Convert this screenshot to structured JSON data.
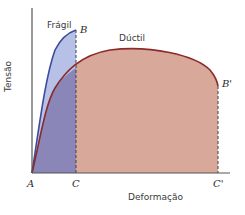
{
  "diagram": {
    "type": "stress-strain",
    "axes": {
      "ylabel": "Tensão",
      "xlabel": "Deformação"
    },
    "curves": [
      {
        "name": "Frágil",
        "end_label": "B",
        "color": "#3b4c9a",
        "fill": "#b7c0e6"
      },
      {
        "name": "Dúctil",
        "end_label": "B'",
        "color": "#8a2a2a",
        "fill": "#d8a89a"
      }
    ],
    "points": {
      "origin": "A",
      "brittle_strain": "C",
      "ductile_strain": "C'"
    },
    "overlap_fill": "#8a86b8",
    "colors": {
      "axis": "#555555",
      "dashed": "#444444"
    }
  }
}
